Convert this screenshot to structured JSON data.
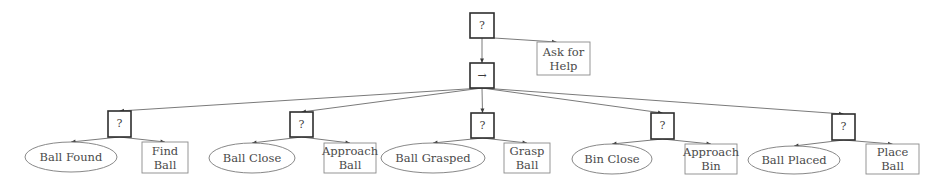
{
  "diagram": {
    "type": "behavior-tree",
    "colors": {
      "background": "#ffffff",
      "edge": "#6b6b6b",
      "control_border": "#2e2e2e",
      "leaf_border": "#8a8a8a",
      "text": "#4a4a4a"
    },
    "root": {
      "id": "root",
      "kind": "fallback",
      "symbol": "?",
      "box": {
        "x": 470,
        "y": 13,
        "w": 24,
        "h": 25
      }
    },
    "ask_help": {
      "id": "ask-help",
      "kind": "action",
      "lines": [
        "Ask for",
        "Help"
      ],
      "box": {
        "x": 537,
        "y": 42,
        "w": 53,
        "h": 33
      }
    },
    "sequence": {
      "id": "sequence",
      "kind": "sequence",
      "symbol": "→",
      "box": {
        "x": 470,
        "y": 63,
        "w": 24,
        "h": 25
      }
    },
    "subtrees": [
      {
        "fallback": {
          "symbol": "?",
          "box": {
            "x": 108,
            "y": 111,
            "w": 23,
            "h": 26
          }
        },
        "condition": {
          "label": "Ball Found",
          "cx": 71,
          "cy": 157,
          "rx": 46,
          "ry": 15
        },
        "action": {
          "lines": [
            "Find",
            "Ball"
          ],
          "box": {
            "x": 142,
            "y": 142,
            "w": 46,
            "h": 31
          }
        }
      },
      {
        "fallback": {
          "symbol": "?",
          "box": {
            "x": 290,
            "y": 112,
            "w": 23,
            "h": 25
          }
        },
        "condition": {
          "label": "Ball Close",
          "cx": 252,
          "cy": 158,
          "rx": 43,
          "ry": 15
        },
        "action": {
          "lines": [
            "Approach",
            "Ball"
          ],
          "box": {
            "x": 324,
            "y": 143,
            "w": 52,
            "h": 30
          }
        }
      },
      {
        "fallback": {
          "symbol": "?",
          "box": {
            "x": 471,
            "y": 113,
            "w": 23,
            "h": 25
          }
        },
        "condition": {
          "label": "Ball Grasped",
          "cx": 433,
          "cy": 158,
          "rx": 52,
          "ry": 15
        },
        "action": {
          "lines": [
            "Grasp",
            "Ball"
          ],
          "box": {
            "x": 504,
            "y": 143,
            "w": 46,
            "h": 30
          }
        }
      },
      {
        "fallback": {
          "symbol": "?",
          "box": {
            "x": 651,
            "y": 113,
            "w": 23,
            "h": 26
          }
        },
        "condition": {
          "label": "Bin Close",
          "cx": 612,
          "cy": 159,
          "rx": 40,
          "ry": 15
        },
        "action": {
          "lines": [
            "Approach",
            "Bin"
          ],
          "box": {
            "x": 685,
            "y": 144,
            "w": 52,
            "h": 30
          }
        }
      },
      {
        "fallback": {
          "symbol": "?",
          "box": {
            "x": 832,
            "y": 114,
            "w": 23,
            "h": 26
          }
        },
        "condition": {
          "label": "Ball Placed",
          "cx": 794,
          "cy": 160,
          "rx": 46,
          "ry": 14
        },
        "action": {
          "lines": [
            "Place",
            "Ball"
          ],
          "box": {
            "x": 866,
            "y": 144,
            "w": 53,
            "h": 30
          }
        }
      }
    ]
  }
}
